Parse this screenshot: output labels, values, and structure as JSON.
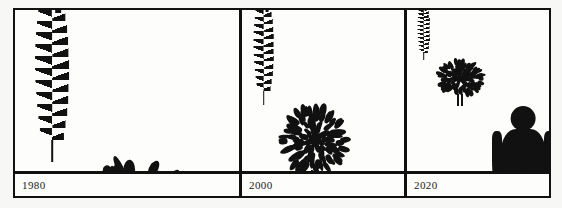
{
  "chart_data": {
    "type": "bar",
    "title": "",
    "subtitle": "",
    "xlabel": "",
    "ylabel": "Relative size",
    "legend_position": "none",
    "grid": false,
    "categories": [
      "1980",
      "2000",
      "2020"
    ],
    "series": [
      {
        "name": "wheat",
        "values": [
          100,
          62,
          32
        ]
      },
      {
        "name": "tree",
        "values": [
          100,
          58,
          30
        ]
      },
      {
        "name": "human",
        "values": [
          34,
          56,
          86
        ]
      }
    ],
    "annotations": [
      "Wheat and tree pictograms shrink from 1980 to 2020 while the human pictogram grows."
    ]
  },
  "figure": {
    "border_color": "#111111",
    "ink_color": "#111111",
    "background_color": "#fdfdfc",
    "panels": [
      {
        "id": "panel-1980",
        "year_label": "1980",
        "items": [
          {
            "icon": "wheat-icon",
            "name": "wheat-1980",
            "scale": 100
          },
          {
            "icon": "tree-icon",
            "name": "tree-1980",
            "scale": 100
          },
          {
            "icon": "person-icon",
            "name": "person-1980",
            "scale": 34
          }
        ]
      },
      {
        "id": "panel-2000",
        "year_label": "2000",
        "items": [
          {
            "icon": "wheat-icon",
            "name": "wheat-2000",
            "scale": 62
          },
          {
            "icon": "tree-icon",
            "name": "tree-2000",
            "scale": 58
          },
          {
            "icon": "person-icon",
            "name": "person-2000",
            "scale": 56
          }
        ]
      },
      {
        "id": "panel-2020",
        "year_label": "2020",
        "items": [
          {
            "icon": "wheat-icon",
            "name": "wheat-2020",
            "scale": 32
          },
          {
            "icon": "tree-icon",
            "name": "tree-2020",
            "scale": 30
          },
          {
            "icon": "person-icon",
            "name": "person-2020",
            "scale": 86
          }
        ]
      }
    ]
  }
}
